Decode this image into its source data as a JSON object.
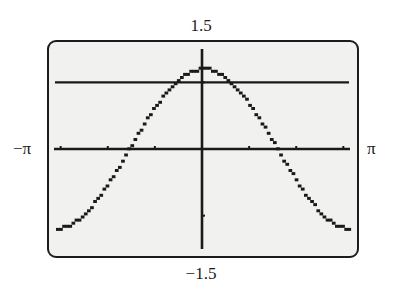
{
  "chart_data": {
    "type": "line",
    "title": "",
    "xlabel": "",
    "ylabel": "",
    "window": {
      "xmin_label": "−π",
      "xmax_label": "π",
      "ymin_label": "−1.5",
      "ymax_label": "1.5",
      "xmin": -3.14159,
      "xmax": 3.14159,
      "ymin": -1.5,
      "ymax": 1.5,
      "xscl": 1,
      "yscl": 1
    },
    "grid": false,
    "legend": null,
    "series": [
      {
        "name": "y1",
        "expression": "1.2cos(x)",
        "style": "pixelated-dots",
        "x": [
          -3.14,
          -2.5,
          -2.0,
          -1.57,
          -1.0,
          -0.5,
          0,
          0.5,
          1.0,
          1.57,
          2.0,
          2.5,
          3.14
        ],
        "y": [
          -1.2,
          -0.96,
          -0.5,
          0.0,
          0.65,
          1.05,
          1.2,
          1.05,
          0.65,
          0.0,
          -0.5,
          -0.96,
          -1.2
        ]
      },
      {
        "name": "y2",
        "expression": "1",
        "style": "solid",
        "x": [
          -3.14,
          3.14
        ],
        "y": [
          1,
          1
        ]
      }
    ],
    "x_ticks": [
      -3,
      -2,
      -1,
      1,
      2,
      3
    ],
    "y_ticks": [
      -1,
      1
    ]
  },
  "colors": {
    "ink": "#1a1a1a",
    "screen_bg": "#f1f1f0",
    "page_bg": "#ffffff"
  },
  "layout": {
    "plot_px": {
      "left": 54,
      "right": 350,
      "top": 49,
      "bottom": 249
    }
  }
}
